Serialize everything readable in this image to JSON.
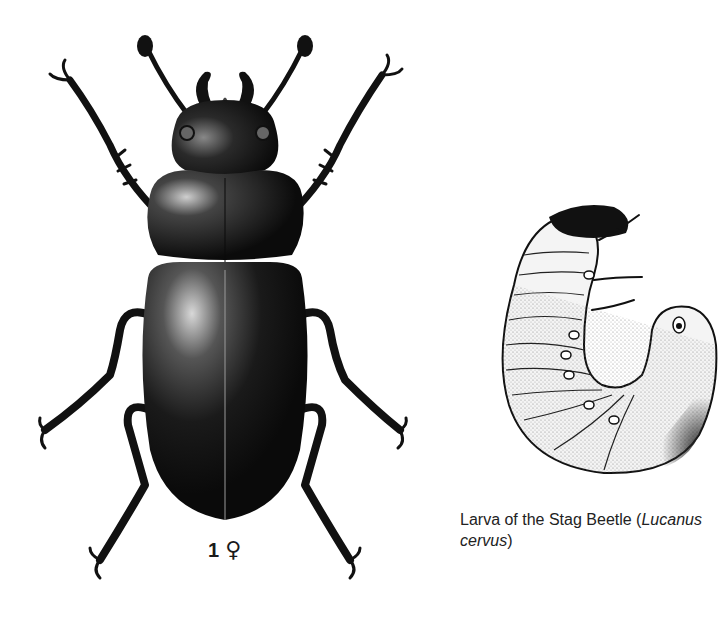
{
  "plate": {
    "figures": [
      {
        "id": "stag-beetle-female",
        "illustration": "stag-beetle-female-dorsal-view",
        "label_number": "1",
        "label_symbol": "♀",
        "label_symbol_meaning": "female"
      },
      {
        "id": "stag-beetle-larva",
        "illustration": "stag-beetle-larva-side-view",
        "caption_text": "Larva of the Stag Beetle (",
        "caption_italic": "Lucanus cervus",
        "caption_close": ")"
      }
    ]
  },
  "colors": {
    "background": "#ffffff",
    "ink": "#111111",
    "text": "#1a1a1a"
  }
}
